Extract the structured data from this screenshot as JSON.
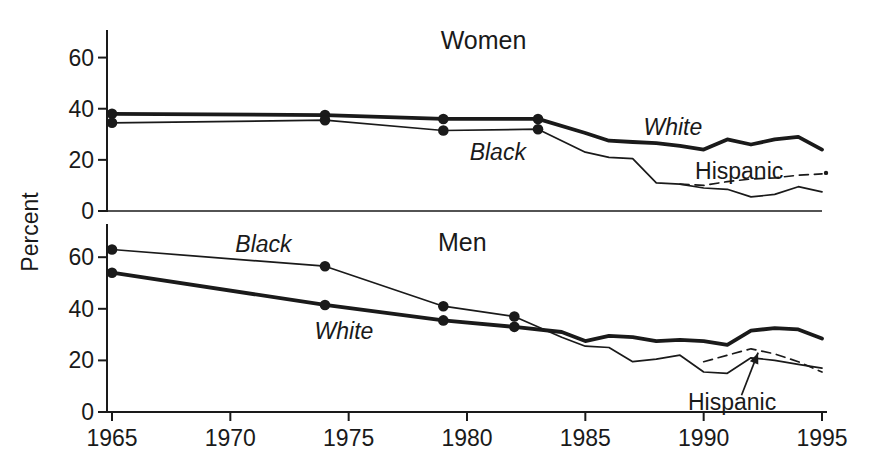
{
  "chart_data": {
    "type": "line",
    "title": "",
    "xlabel": "",
    "ylabel": "Percent",
    "xlim": [
      1965,
      1995
    ],
    "ylim": [
      0,
      70
    ],
    "x_ticks": [
      1965,
      1970,
      1975,
      1980,
      1985,
      1990,
      1995
    ],
    "y_ticks": [
      0,
      20,
      40,
      60
    ],
    "grid": false,
    "legend_position": "inline-labels",
    "ink_color": "#1a1a1a",
    "background_color": "#ffffff",
    "panels": [
      {
        "title": "Women",
        "title_pos": [
          1980.7,
          67
        ],
        "series": [
          {
            "name": "White",
            "line": "thick",
            "dash": false,
            "marker_years": [
              1965,
              1974,
              1979,
              1983
            ],
            "points": [
              [
                1965,
                38
              ],
              [
                1974,
                37.5
              ],
              [
                1979,
                36
              ],
              [
                1983,
                36
              ],
              [
                1985,
                30.5
              ],
              [
                1986,
                27.5
              ],
              [
                1987,
                27
              ],
              [
                1988,
                26.5
              ],
              [
                1989,
                25.5
              ],
              [
                1990,
                24
              ],
              [
                1991,
                28
              ],
              [
                1992,
                26
              ],
              [
                1993,
                28
              ],
              [
                1994,
                29
              ],
              [
                1995,
                24
              ]
            ],
            "label": {
              "text": "White",
              "italic": true,
              "pos": [
                1988.7,
                33
              ]
            }
          },
          {
            "name": "Black",
            "line": "thin",
            "dash": false,
            "marker_years": [
              1965,
              1974,
              1979,
              1983
            ],
            "points": [
              [
                1965,
                34.5
              ],
              [
                1974,
                35.5
              ],
              [
                1979,
                31.5
              ],
              [
                1983,
                32
              ],
              [
                1985,
                23
              ],
              [
                1986,
                21
              ],
              [
                1987,
                20.5
              ],
              [
                1988,
                11
              ],
              [
                1989,
                10.5
              ],
              [
                1990,
                9
              ],
              [
                1991,
                8.5
              ],
              [
                1992,
                5.5
              ],
              [
                1993,
                6.5
              ],
              [
                1994,
                9.5
              ],
              [
                1995,
                7.5
              ]
            ],
            "label": {
              "text": "Black",
              "italic": true,
              "pos": [
                1981.3,
                23
              ]
            }
          },
          {
            "name": "Hispanic",
            "line": "thin",
            "dash": true,
            "end_dot": true,
            "marker_years": [],
            "points": [
              [
                1989,
                10.5
              ],
              [
                1990,
                10
              ],
              [
                1991,
                11.5
              ],
              [
                1992,
                12.5
              ],
              [
                1993,
                13
              ],
              [
                1994,
                14
              ],
              [
                1995,
                14.5
              ]
            ],
            "label": {
              "text": "Hispanic",
              "italic": false,
              "pos": [
                1991.5,
                15.5
              ]
            }
          }
        ]
      },
      {
        "title": "Men",
        "title_pos": [
          1979.8,
          66
        ],
        "series": [
          {
            "name": "White",
            "line": "thick",
            "dash": false,
            "marker_years": [
              1965,
              1974,
              1979,
              1982
            ],
            "points": [
              [
                1965,
                54
              ],
              [
                1974,
                41.5
              ],
              [
                1979,
                35.5
              ],
              [
                1982,
                33
              ],
              [
                1984,
                31
              ],
              [
                1985,
                27.5
              ],
              [
                1986,
                29.5
              ],
              [
                1987,
                29
              ],
              [
                1988,
                27.5
              ],
              [
                1989,
                28
              ],
              [
                1990,
                27.5
              ],
              [
                1991,
                26
              ],
              [
                1992,
                31.5
              ],
              [
                1993,
                32.5
              ],
              [
                1994,
                32
              ],
              [
                1995,
                28.5
              ]
            ],
            "label": {
              "text": "White",
              "italic": true,
              "pos": [
                1974.8,
                31.5
              ]
            }
          },
          {
            "name": "Black",
            "line": "thin",
            "dash": false,
            "marker_years": [
              1965,
              1974,
              1979,
              1982
            ],
            "points": [
              [
                1965,
                63
              ],
              [
                1974,
                56.5
              ],
              [
                1979,
                41
              ],
              [
                1982,
                37
              ],
              [
                1984,
                29
              ],
              [
                1985,
                25.5
              ],
              [
                1986,
                25
              ],
              [
                1987,
                19.5
              ],
              [
                1988,
                20.5
              ],
              [
                1989,
                22
              ],
              [
                1990,
                15.5
              ],
              [
                1991,
                15
              ],
              [
                1992,
                21
              ],
              [
                1993,
                20
              ],
              [
                1994,
                18.5
              ],
              [
                1995,
                17
              ]
            ],
            "label": {
              "text": "Black",
              "italic": true,
              "pos": [
                1971.4,
                65
              ]
            }
          },
          {
            "name": "Hispanic",
            "line": "thin",
            "dash": true,
            "marker_years": [],
            "points": [
              [
                1990,
                19.5
              ],
              [
                1991,
                22
              ],
              [
                1992,
                24.5
              ],
              [
                1993,
                22.5
              ],
              [
                1994,
                19.5
              ],
              [
                1995,
                15.5
              ]
            ],
            "label": {
              "text": "Hispanic",
              "italic": false,
              "pos": [
                1991.2,
                4
              ]
            },
            "annotation_arrow": {
              "from": [
                1991.6,
                6.5
              ],
              "to": [
                1992.3,
                23
              ]
            }
          }
        ]
      }
    ]
  }
}
